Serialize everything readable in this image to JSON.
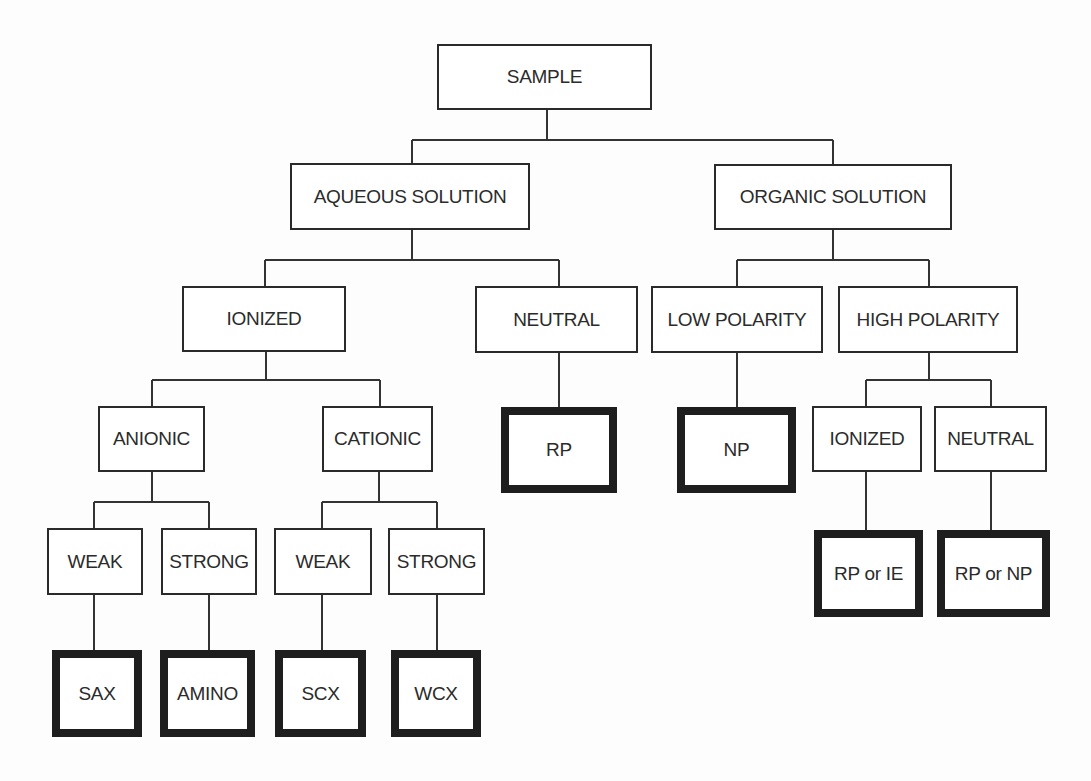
{
  "diagram": {
    "type": "decision-tree",
    "colors": {
      "line": "#333333",
      "text": "#2b2b2b",
      "border": "#2a2a2a",
      "background": "#fdfdfd"
    },
    "nodes": [
      {
        "id": "sample",
        "label": "SAMPLE",
        "x": 437,
        "y": 44,
        "w": 215,
        "h": 66,
        "terminal": false
      },
      {
        "id": "aqueous",
        "label": "AQUEOUS SOLUTION",
        "x": 290,
        "y": 163,
        "w": 240,
        "h": 67,
        "terminal": false
      },
      {
        "id": "organic",
        "label": "ORGANIC SOLUTION",
        "x": 714,
        "y": 164,
        "w": 238,
        "h": 66,
        "terminal": false
      },
      {
        "id": "ionized",
        "label": "IONIZED",
        "x": 182,
        "y": 286,
        "w": 164,
        "h": 66,
        "terminal": false
      },
      {
        "id": "neutral",
        "label": "NEUTRAL",
        "x": 475,
        "y": 286,
        "w": 163,
        "h": 67,
        "terminal": false
      },
      {
        "id": "low-polarity",
        "label": "LOW POLARITY",
        "x": 651,
        "y": 286,
        "w": 172,
        "h": 67,
        "terminal": false
      },
      {
        "id": "high-polarity",
        "label": "HIGH POLARITY",
        "x": 838,
        "y": 286,
        "w": 180,
        "h": 67,
        "terminal": false
      },
      {
        "id": "anionic",
        "label": "ANIONIC",
        "x": 98,
        "y": 406,
        "w": 107,
        "h": 66,
        "terminal": false
      },
      {
        "id": "cationic",
        "label": "CATIONIC",
        "x": 322,
        "y": 406,
        "w": 111,
        "h": 66,
        "terminal": false
      },
      {
        "id": "rp",
        "label": "RP",
        "x": 501,
        "y": 407,
        "w": 116,
        "h": 86,
        "terminal": true
      },
      {
        "id": "np",
        "label": "NP",
        "x": 677,
        "y": 407,
        "w": 119,
        "h": 86,
        "terminal": true
      },
      {
        "id": "ionized-organic",
        "label": "IONIZED",
        "x": 812,
        "y": 406,
        "w": 110,
        "h": 66,
        "terminal": false
      },
      {
        "id": "neutral-organic",
        "label": "NEUTRAL",
        "x": 934,
        "y": 406,
        "w": 113,
        "h": 66,
        "terminal": false
      },
      {
        "id": "weak-anionic",
        "label": "WEAK",
        "x": 47,
        "y": 528,
        "w": 96,
        "h": 67,
        "terminal": false
      },
      {
        "id": "strong-anionic",
        "label": "STRONG",
        "x": 161,
        "y": 528,
        "w": 96,
        "h": 67,
        "terminal": false
      },
      {
        "id": "weak-cationic",
        "label": "WEAK",
        "x": 274,
        "y": 528,
        "w": 98,
        "h": 67,
        "terminal": false
      },
      {
        "id": "strong-cationic",
        "label": "STRONG",
        "x": 388,
        "y": 528,
        "w": 97,
        "h": 67,
        "terminal": false
      },
      {
        "id": "rp-or-ie",
        "label": "RP or IE",
        "x": 814,
        "y": 530,
        "w": 109,
        "h": 87,
        "terminal": true
      },
      {
        "id": "rp-or-np",
        "label": "RP or NP",
        "x": 937,
        "y": 530,
        "w": 113,
        "h": 87,
        "terminal": true
      },
      {
        "id": "sax",
        "label": "SAX",
        "x": 52,
        "y": 650,
        "w": 90,
        "h": 87,
        "terminal": true
      },
      {
        "id": "amino",
        "label": "AMINO",
        "x": 160,
        "y": 650,
        "w": 95,
        "h": 87,
        "terminal": true
      },
      {
        "id": "scx",
        "label": "SCX",
        "x": 275,
        "y": 650,
        "w": 91,
        "h": 87,
        "terminal": true
      },
      {
        "id": "wcx",
        "label": "WCX",
        "x": 391,
        "y": 650,
        "w": 90,
        "h": 87,
        "terminal": true
      }
    ],
    "edges": [
      {
        "from": "sample",
        "stem_x": 547,
        "bar_y": 140,
        "children_x": [
          412,
          833
        ]
      },
      {
        "from": "aqueous",
        "stem_x": 412,
        "bar_y": 260,
        "children_x": [
          265,
          559
        ]
      },
      {
        "from": "organic",
        "stem_x": 833,
        "bar_y": 260,
        "children_x": [
          737,
          929
        ]
      },
      {
        "from": "ionized",
        "stem_x": 266,
        "bar_y": 380,
        "children_x": [
          152,
          380
        ]
      },
      {
        "from": "high-polarity",
        "stem_x": 929,
        "bar_y": 380,
        "children_x": [
          866,
          991
        ]
      },
      {
        "from": "anionic",
        "stem_x": 152,
        "bar_y": 502,
        "children_x": [
          94,
          209
        ]
      },
      {
        "from": "cationic",
        "stem_x": 379,
        "bar_y": 502,
        "children_x": [
          322,
          437
        ]
      }
    ],
    "direct_edges": [
      {
        "x": 559,
        "y1": 353,
        "y2": 407
      },
      {
        "x": 737,
        "y1": 353,
        "y2": 407
      },
      {
        "x": 866,
        "y1": 472,
        "y2": 530
      },
      {
        "x": 991,
        "y1": 472,
        "y2": 530
      },
      {
        "x": 94,
        "y1": 595,
        "y2": 650
      },
      {
        "x": 209,
        "y1": 595,
        "y2": 650
      },
      {
        "x": 322,
        "y1": 595,
        "y2": 650
      },
      {
        "x": 437,
        "y1": 595,
        "y2": 650
      }
    ]
  }
}
